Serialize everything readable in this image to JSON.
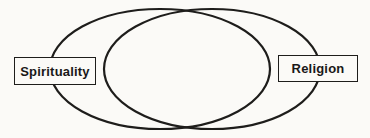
{
  "diagram": {
    "kind": "venn-diagram",
    "background_color": "#fbfaf7",
    "line_color": "#1e1d1b",
    "ellipses": [
      {
        "id": "spirituality-ellipse",
        "cx": 160,
        "cy": 69,
        "rx": 110,
        "ry": 60
      },
      {
        "id": "religion-ellipse",
        "cx": 212,
        "cy": 69,
        "rx": 108,
        "ry": 60
      }
    ],
    "labels": {
      "left": "Spirituality",
      "right": "Religion"
    }
  }
}
